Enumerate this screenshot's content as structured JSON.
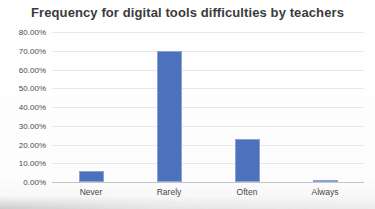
{
  "chart_data": {
    "type": "bar",
    "title": "Frequency for digital tools difficulties by teachers",
    "categories": [
      "Never",
      "Rarely",
      "Often",
      "Always"
    ],
    "values": [
      6,
      70,
      23,
      1
    ],
    "xlabel": "",
    "ylabel": "",
    "ylim": [
      0,
      80
    ],
    "ytick_step": 10,
    "ytick_labels": [
      "0.00%",
      "10.00%",
      "20.00%",
      "30.00%",
      "40.00%",
      "50.00%",
      "60.00%",
      "70.00%",
      "80.00%"
    ],
    "grid": true,
    "legend": false,
    "bar_color": "#4d72bd",
    "gridline_color": "#e6e8ea",
    "axis_line_color": "#c3c7cc",
    "title_color": "#3b3b3b",
    "label_color": "#4a4a4a"
  }
}
